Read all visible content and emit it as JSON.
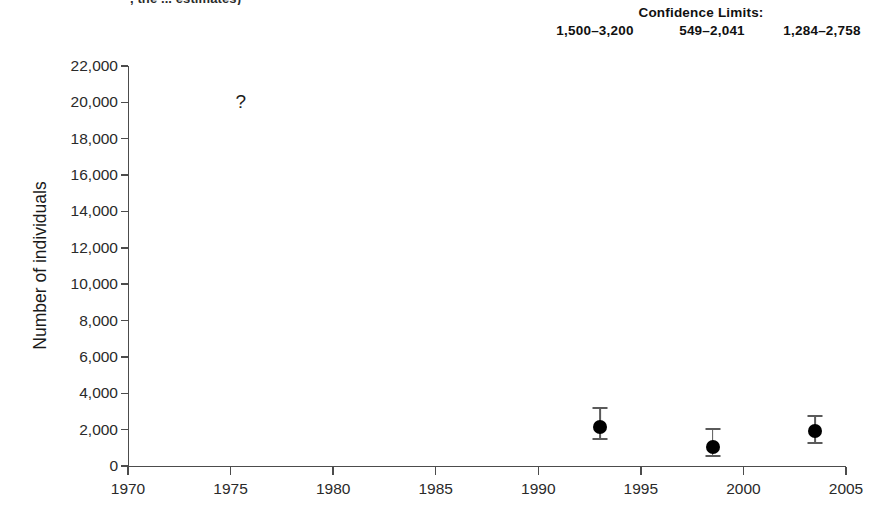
{
  "clipped_caption": ", the ... estimates)",
  "confidence": {
    "title": "Confidence Limits:",
    "values": [
      "1,500–3,200",
      "549–2,041",
      "1,284–2,758"
    ]
  },
  "axes": {
    "ylabel": "Number of individuals",
    "ytick_labels": [
      "0",
      "2,000",
      "4,000",
      "6,000",
      "8,000",
      "10,000",
      "12,000",
      "14,000",
      "16,000",
      "18,000",
      "20,000",
      "22,000"
    ],
    "xtick_labels": [
      "1970",
      "1975",
      "1980",
      "1985",
      "1990",
      "1995",
      "2000",
      "2005"
    ]
  },
  "annotation": {
    "unknown_symbol": "?"
  },
  "chart_data": {
    "type": "scatter",
    "title": "",
    "subtitle": "Confidence Limits:",
    "xlabel": "",
    "ylabel": "Number of individuals",
    "xlim": [
      1970,
      2005
    ],
    "ylim": [
      0,
      22000
    ],
    "xticks": [
      1970,
      1975,
      1980,
      1985,
      1990,
      1995,
      2000,
      2005
    ],
    "yticks": [
      0,
      2000,
      4000,
      6000,
      8000,
      10000,
      12000,
      14000,
      16000,
      18000,
      20000,
      22000
    ],
    "grid": false,
    "legend": null,
    "series": [
      {
        "name": "Population estimate",
        "marker": "filled-circle",
        "color": "#000000",
        "points": [
          {
            "x": 1993.0,
            "y": 2150,
            "yerr_low": 1500,
            "yerr_high": 3200,
            "ci_label": "1,500–3,200"
          },
          {
            "x": 1998.5,
            "y": 1050,
            "yerr_low": 549,
            "yerr_high": 2041,
            "ci_label": "549–2,041"
          },
          {
            "x": 2003.5,
            "y": 1900,
            "yerr_low": 1284,
            "yerr_high": 2758,
            "ci_label": "1,284–2,758"
          }
        ]
      }
    ],
    "annotations": [
      {
        "x": 1975.5,
        "y": 20000,
        "text": "?",
        "note": "historic estimate, uncertain"
      }
    ]
  }
}
